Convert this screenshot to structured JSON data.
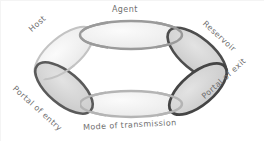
{
  "diagram": {
    "background_color": "#ffffff",
    "border_color": "#e9e9e9",
    "label_color": "#6f6f6f",
    "light_stroke": "#c6c6c6",
    "dark_stroke": "#4a4a4a",
    "light_fill": "#efefef",
    "dark_fill": "#d6d6d6",
    "nodes": [
      {
        "id": "agent",
        "label": "Agent",
        "style": "light",
        "cx": 131,
        "cy": 35,
        "rx": 51,
        "ry": 14,
        "rotate": 0,
        "label_x": 112,
        "label_y": 8,
        "label_rotate": 0
      },
      {
        "id": "reservoir",
        "label": "Reservoir",
        "style": "dark",
        "cx": 197,
        "cy": 54,
        "rx": 36,
        "ry": 16,
        "rotate": 40,
        "label_x": 205,
        "label_y": 20,
        "label_rotate": 42
      },
      {
        "id": "portal-of-exit",
        "label": "Portal of exit",
        "style": "dark",
        "cx": 198,
        "cy": 89,
        "rx": 35,
        "ry": 16,
        "rotate": -40,
        "label_x": 205,
        "label_y": 94,
        "label_rotate": -42
      },
      {
        "id": "mode-of-transmission",
        "label": "Mode of transmission",
        "style": "light",
        "cx": 131,
        "cy": 104,
        "rx": 51,
        "ry": 13,
        "rotate": 0,
        "label_x": 86,
        "label_y": 126,
        "label_rotate": -3
      },
      {
        "id": "portal-of-entry",
        "label": "Portal of entry",
        "style": "dark",
        "cx": 64,
        "cy": 88,
        "rx": 35,
        "ry": 16,
        "rotate": 40,
        "label_x": 16,
        "label_y": 85,
        "label_rotate": 42
      },
      {
        "id": "host",
        "label": "Host",
        "style": "light",
        "cx": 64,
        "cy": 53,
        "rx": 36,
        "ry": 16,
        "rotate": -40,
        "label_x": 31,
        "label_y": 28,
        "label_rotate": -42
      }
    ]
  }
}
